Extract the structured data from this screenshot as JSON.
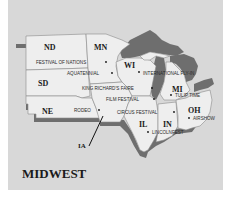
{
  "map": {
    "title": "MIDWEST",
    "colors": {
      "background": "#d8d8d8",
      "land": "#eeeeee",
      "shadow": "#6e6e6e",
      "borders": "#8a8a8a",
      "text": "#1a1a1a"
    },
    "states": [
      {
        "abbr": "ND"
      },
      {
        "abbr": "MN"
      },
      {
        "abbr": "SD"
      },
      {
        "abbr": "WI"
      },
      {
        "abbr": "NE"
      },
      {
        "abbr": "MI"
      },
      {
        "abbr": "OH"
      },
      {
        "abbr": "IL"
      },
      {
        "abbr": "IN"
      },
      {
        "abbr": "IA"
      }
    ],
    "events": [
      {
        "label": "FESTIVAL OF NATIONS"
      },
      {
        "label": "AQUATENNIAL"
      },
      {
        "label": "INTERNATIONAL FLY-IN"
      },
      {
        "label": "KING RICHARD'S FAIRE"
      },
      {
        "label": "TULIP TIME"
      },
      {
        "label": "FILM FESTIVAL"
      },
      {
        "label": "RODEO"
      },
      {
        "label": "CIRCUS FESTIVAL"
      },
      {
        "label": "AIRSHOW"
      },
      {
        "label": "LINCOLNFEST"
      }
    ]
  }
}
